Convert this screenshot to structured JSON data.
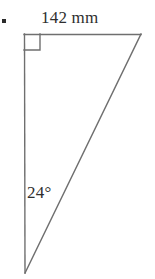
{
  "figure": {
    "kind": "right-triangle-diagram",
    "bullet": "▪",
    "stroke_color": "#6f6f6f",
    "text_color": "#2e2e2e",
    "background_color": "#ffffff",
    "labels": {
      "top_side_length": "142 mm",
      "bottom_angle": "24°"
    },
    "geometry": {
      "vertices": {
        "top_left": {
          "x": 24,
          "y": 34
        },
        "top_right": {
          "x": 141,
          "y": 34
        },
        "bottom_left": {
          "x": 25,
          "y": 273
        }
      },
      "right_angle_marker": {
        "at": "top_left",
        "size": 16
      }
    },
    "measurements": {
      "top_side": {
        "value": 142,
        "unit": "mm",
        "text": "142 mm"
      },
      "angle_at_bottom_vertex": {
        "value": 24,
        "unit": "degrees",
        "text": "24°"
      }
    }
  }
}
